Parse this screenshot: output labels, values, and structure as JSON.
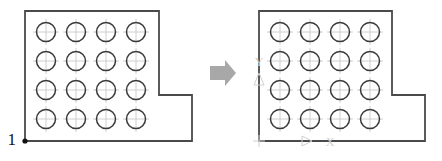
{
  "figure": {
    "background_color": "#ffffff",
    "outline_color": "#4a4a4a",
    "circle_color": "#3a3a3a",
    "center_mark_color": "#b9b9b9",
    "axis_hint_color": "#cfcfcf",
    "arrow_color": "#a8a8a8",
    "label_color": "#1a1a1a",
    "width": 442,
    "height": 161
  },
  "panels": [
    {
      "id": "before",
      "name": "left-diagram",
      "origin_label": "1",
      "origin_point": {
        "x": 25,
        "y": 141
      },
      "outline_points": "25,11 159,11 159,95 192,95 192,141 25,141",
      "holes": {
        "rows": 4,
        "cols": 4,
        "radius": 9.5,
        "start_x": 46,
        "start_y": 32,
        "step_x": 30,
        "step_y": 29,
        "count": 16
      },
      "axis_hints": []
    },
    {
      "id": "after",
      "name": "right-diagram",
      "origin_label": "",
      "outline_points": "259,11 392,11 392,95 425,95 425,141 259,141",
      "holes": {
        "rows": 4,
        "cols": 4,
        "radius": 9.5,
        "start_x": 280,
        "start_y": 32,
        "step_x": 30,
        "step_y": 29,
        "count": 16
      },
      "axis_hints": [
        {
          "name": "y-axis-label",
          "glyph": "Y",
          "x": 259,
          "y": 62
        },
        {
          "name": "y-axis-arrow",
          "glyph": "triangle-up",
          "x": 259,
          "y": 80
        },
        {
          "name": "x-axis-arrow",
          "glyph": "triangle-right",
          "x": 307,
          "y": 141
        },
        {
          "name": "x-axis-label",
          "glyph": "X",
          "x": 330,
          "y": 141
        },
        {
          "name": "origin-tick",
          "glyph": "cross",
          "x": 259,
          "y": 141
        }
      ]
    }
  ],
  "transition": {
    "name": "arrow-right",
    "label": "",
    "x": 210,
    "y": 72,
    "width": 26,
    "height": 20
  }
}
